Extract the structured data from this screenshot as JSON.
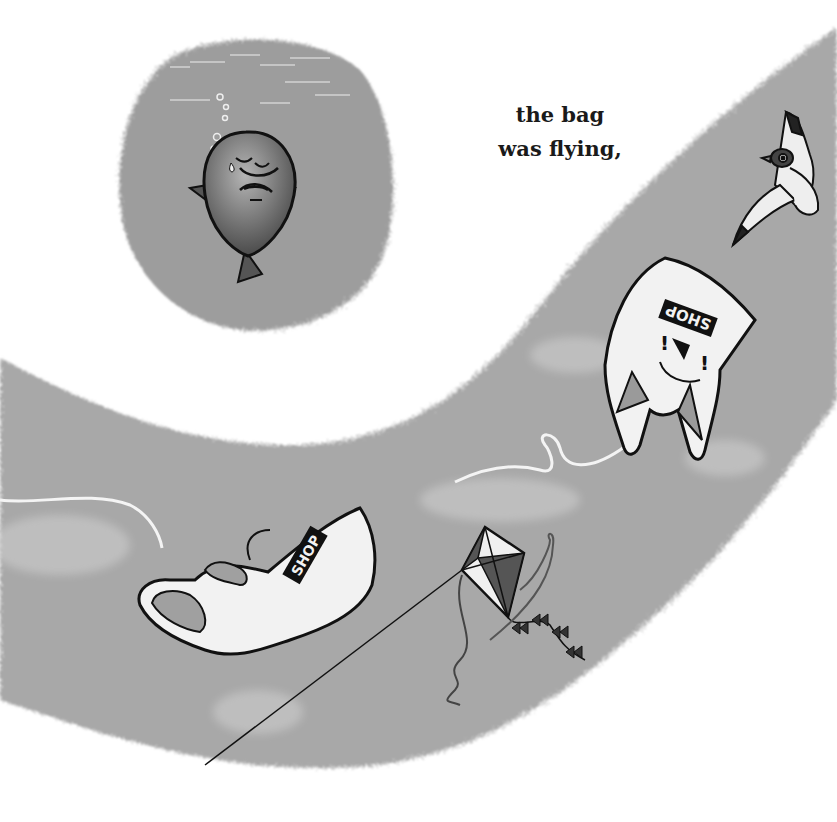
{
  "page": {
    "caption_lines": [
      "the bag",
      "was flying,"
    ]
  },
  "illustration": {
    "style": "grayscale picture-book illustration",
    "colors": {
      "background": "#ffffff",
      "sky_band": "#a9a9a9",
      "water_circle": "#9e9e9e",
      "outline": "#111111",
      "bag_fill": "#f2f2f2"
    },
    "elements": [
      {
        "name": "sad-fish-underwater",
        "description": "sad crying fish in circular underwater vignette"
      },
      {
        "name": "flying-bag-right",
        "description": "plastic bag with smiley face flying in sky",
        "print_text": "SHOP"
      },
      {
        "name": "flying-bag-left",
        "description": "plastic bag blowing sideways",
        "print_text": "SHOP"
      },
      {
        "name": "kite",
        "description": "diamond kite with bow tail"
      },
      {
        "name": "seagull",
        "description": "seagull flying"
      }
    ],
    "bag_print": {
      "text": "SHOP"
    }
  }
}
